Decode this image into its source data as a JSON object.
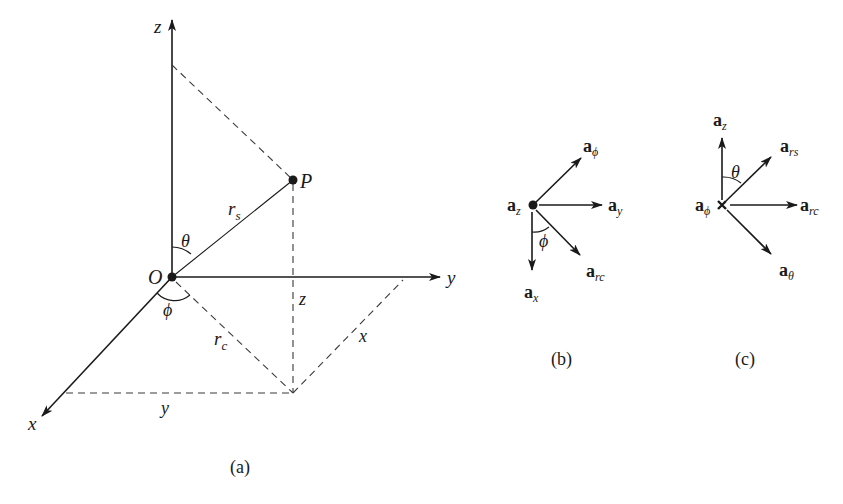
{
  "figure": {
    "panels": [
      {
        "id": "a",
        "caption": "(a)",
        "labels": {
          "z_axis": "z",
          "y_axis": "y",
          "x_axis": "x",
          "origin": "O",
          "point": "P",
          "r_s": "r",
          "r_s_sub": "s",
          "r_c": "r",
          "r_c_sub": "c",
          "theta": "θ",
          "phi": "ϕ",
          "z_len": "z",
          "x_len": "x",
          "y_len": "y"
        }
      },
      {
        "id": "b",
        "caption": "(b)",
        "vectors": [
          {
            "base": "a",
            "sub": "ϕ"
          },
          {
            "base": "a",
            "sub": "y"
          },
          {
            "base": "a",
            "sub": "rc"
          },
          {
            "base": "a",
            "sub": "x"
          }
        ],
        "center_label": {
          "base": "a",
          "sub": "z"
        },
        "angle_label": "ϕ"
      },
      {
        "id": "c",
        "caption": "(c)",
        "vectors": [
          {
            "base": "a",
            "sub": "z"
          },
          {
            "base": "a",
            "sub": "rs"
          },
          {
            "base": "a",
            "sub": "rc"
          },
          {
            "base": "a",
            "sub": "θ"
          }
        ],
        "center_label": {
          "base": "a",
          "sub": "ϕ"
        },
        "angle_label": "θ"
      }
    ],
    "colors": {
      "ink": "#1a1a1a",
      "dash": "#3a3a3a",
      "background": "#ffffff"
    }
  }
}
